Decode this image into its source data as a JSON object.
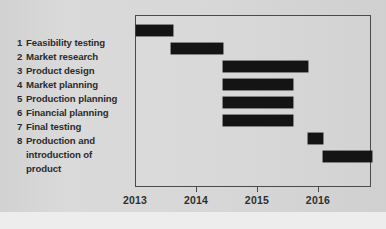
{
  "chart_data": {
    "type": "bar",
    "chart_kind": "gantt",
    "title": "",
    "xlabel": "",
    "ylabel": "",
    "xlim": [
      2013,
      2016.87
    ],
    "grid": false,
    "legend": null,
    "axis_ticks": [
      "2013",
      "2014",
      "2015",
      "2016"
    ],
    "axis_tick_values": [
      2013,
      2014,
      2015,
      2016
    ],
    "categories": [
      "Feasibility testing",
      "Market research",
      "Product design",
      "Market planning",
      "Production planning",
      "Financial planning",
      "Final testing",
      "Production and introduction of product"
    ],
    "tasks": [
      {
        "number": "1",
        "label": "Feasibility testing",
        "start": 2013.0,
        "end": 2013.6,
        "duration": 0.6
      },
      {
        "number": "2",
        "label": "Market research",
        "start": 2013.57,
        "end": 2014.43,
        "duration": 0.86
      },
      {
        "number": "3",
        "label": "Product design",
        "start": 2014.43,
        "end": 2015.82,
        "duration": 1.39
      },
      {
        "number": "4",
        "label": "Market planning",
        "start": 2014.43,
        "end": 2015.57,
        "duration": 1.14
      },
      {
        "number": "5",
        "label": "Production planning",
        "start": 2014.43,
        "end": 2015.57,
        "duration": 1.14
      },
      {
        "number": "6",
        "label": "Financial planning",
        "start": 2014.43,
        "end": 2015.57,
        "duration": 1.14
      },
      {
        "number": "7",
        "label": "Final testing",
        "start": 2015.82,
        "end": 2016.07,
        "duration": 0.25
      },
      {
        "number": "8",
        "label": "Production and introduction of product",
        "start": 2016.07,
        "end": 2016.87,
        "duration": 0.8
      }
    ],
    "bar_color": "#141414",
    "background_color": "#d9d9d9",
    "frame_color": "#4a4a4a"
  },
  "task_list": [
    {
      "number": "1",
      "line1": "Feasibility testing",
      "line2": "",
      "line3": ""
    },
    {
      "number": "2",
      "line1": "Market research",
      "line2": "",
      "line3": ""
    },
    {
      "number": "3",
      "line1": "Product design",
      "line2": "",
      "line3": ""
    },
    {
      "number": "4",
      "line1": "Market planning",
      "line2": "",
      "line3": ""
    },
    {
      "number": "5",
      "line1": "Production planning",
      "line2": "",
      "line3": ""
    },
    {
      "number": "6",
      "line1": "Financial planning",
      "line2": "",
      "line3": ""
    },
    {
      "number": "7",
      "line1": "Final testing",
      "line2": "",
      "line3": ""
    },
    {
      "number": "8",
      "line1": "Production and",
      "line2": "introduction of",
      "line3": "product"
    }
  ]
}
